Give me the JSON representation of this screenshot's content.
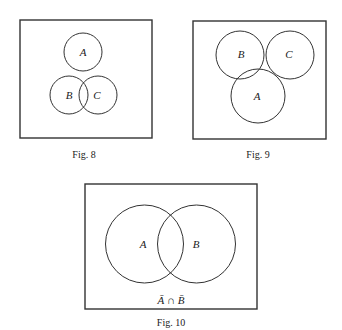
{
  "figures": [
    {
      "caption": "Fig. 8",
      "sets": [
        {
          "label": "A"
        },
        {
          "label": "B"
        },
        {
          "label": "C"
        }
      ]
    },
    {
      "caption": "Fig. 9",
      "sets": [
        {
          "label": "B"
        },
        {
          "label": "C"
        },
        {
          "label": "A"
        }
      ]
    },
    {
      "caption": "Fig. 10",
      "sets": [
        {
          "label": "A"
        },
        {
          "label": "B"
        }
      ],
      "region_label": "Ā ∩ B̄"
    }
  ]
}
